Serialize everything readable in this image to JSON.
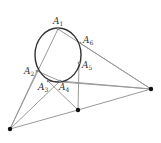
{
  "diagram": {
    "type": "pascal-hexagon",
    "conic": {
      "cx": 58,
      "cy": 55,
      "rx": 23,
      "ry": 27,
      "color": "#333333"
    },
    "hexagon_points": [
      {
        "name": "A",
        "sub": "1",
        "x": 58,
        "y": 29,
        "lx": 53,
        "ly": 24
      },
      {
        "name": "A",
        "sub": "2",
        "x": 37,
        "y": 71,
        "lx": 24,
        "ly": 74
      },
      {
        "name": "A",
        "sub": "3",
        "x": 48,
        "y": 81,
        "lx": 38,
        "ly": 90
      },
      {
        "name": "A",
        "sub": "4",
        "x": 60,
        "y": 81,
        "lx": 59,
        "ly": 90
      },
      {
        "name": "A",
        "sub": "5",
        "x": 79,
        "y": 63,
        "lx": 82,
        "ly": 68
      },
      {
        "name": "A",
        "sub": "6",
        "x": 80,
        "y": 43,
        "lx": 83,
        "ly": 43
      }
    ],
    "intersection_points": [
      {
        "id": "P-left",
        "x": 10,
        "y": 129
      },
      {
        "id": "P-middle",
        "x": 78,
        "y": 110
      },
      {
        "id": "P-right",
        "x": 151,
        "y": 89
      }
    ],
    "line_color": "#9a9a9a",
    "point_color": "#111111"
  }
}
